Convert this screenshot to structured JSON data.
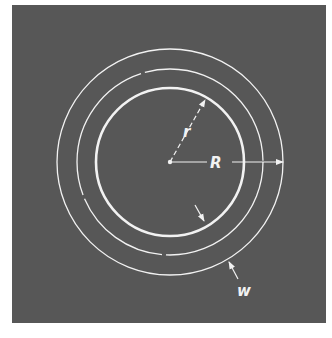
{
  "figure": {
    "background_color": "#575757",
    "line_color": "#f2f2f2",
    "labels": {
      "inner_radius": "r",
      "outer_radius": "R",
      "width": "w"
    },
    "geometry": {
      "center": [
        170,
        162
      ],
      "outer_circle_radius": 113,
      "middle_circle_radius": 93,
      "inner_circle_radius": 74
    }
  }
}
